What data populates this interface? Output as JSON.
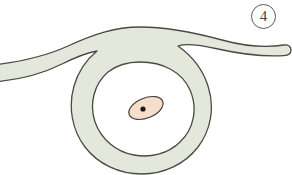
{
  "figure": {
    "number_label": "4",
    "caption": "",
    "background_color": "#ffffff"
  },
  "palette": {
    "cytoplasm_fill": "#e4e8dc",
    "cytoplasm_stroke": "#4a4a42",
    "lumen_fill": "#ffffff",
    "nucleus_fill": "#f6ddcc",
    "nucleus_stroke": "#4a4038",
    "nucleolus_fill": "#1a1a1a",
    "label_stroke": "#5d5d5d",
    "label_text": "#444444"
  },
  "structures": [
    {
      "name": "cytoplasmic-band",
      "description": "thick pale grey-green band forming a ring with two tapering arms extending left and right",
      "fill": "#e4e8dc",
      "stroke": "#4a4a42",
      "stroke_width": 1.3
    },
    {
      "name": "lumen",
      "description": "white interior space enclosed by the cytoplasmic ring",
      "fill": "#ffffff"
    },
    {
      "name": "nucleus",
      "description": "pink tilted ellipse inside the lumen",
      "fill": "#f6ddcc",
      "stroke": "#4a4038",
      "center_x": 146,
      "center_y": 108,
      "radius_x": 18,
      "radius_y": 10,
      "rotation_deg": -22
    },
    {
      "name": "nucleolus",
      "description": "small dark dot within the nucleus",
      "fill": "#1a1a1a",
      "center_x": 143,
      "center_y": 109,
      "radius": 2.6
    }
  ]
}
